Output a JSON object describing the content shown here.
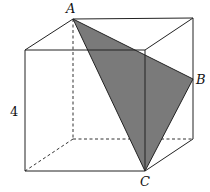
{
  "figure": {
    "type": "cube-cross-section",
    "labels": {
      "A": "A",
      "B": "B",
      "C": "C",
      "edge_length": "4"
    },
    "colors": {
      "triangle_fill": "#7a7a7a",
      "edges": "#222222",
      "background": "#ffffff"
    }
  }
}
